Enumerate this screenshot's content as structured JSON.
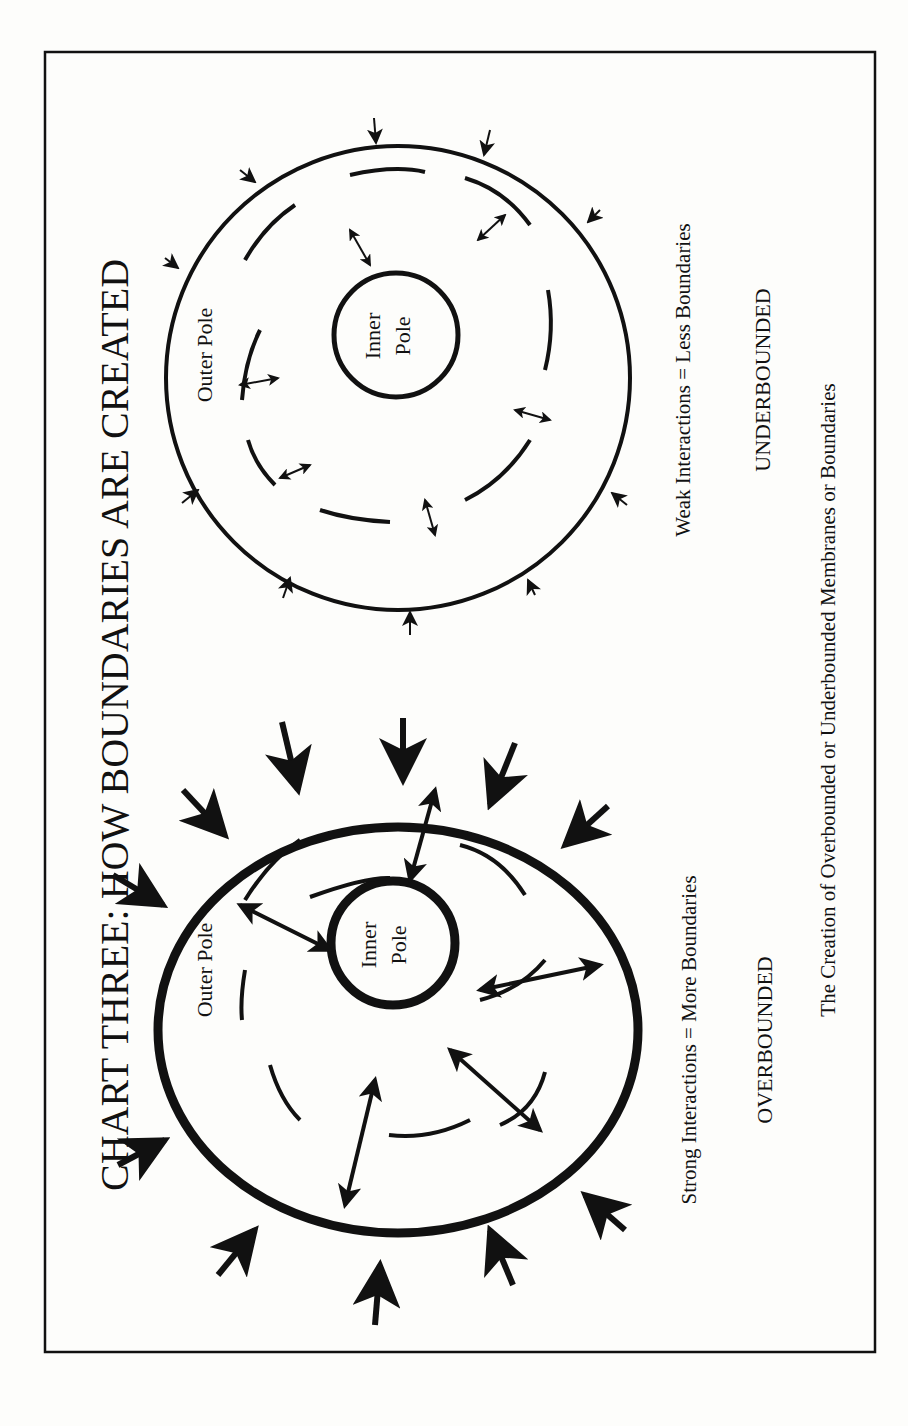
{
  "page": {
    "title": "CHART THREE:   HOW BOUNDARIES ARE CREATED",
    "caption": "The Creation of Overbounded or Underbounded Membranes or Boundaries",
    "orientation": "rotated 90° counter-clockwise (landscape content on portrait page)"
  },
  "left_diagram": {
    "name": "overbounded",
    "outer_label": "Outer Pole",
    "inner_label_line1": "Inner",
    "inner_label_line2": "Pole",
    "description": "Strong Interactions = More Boundaries",
    "label": "OVERBOUNDED",
    "boundary_style": "thick solid outer ring, thick inner ring, bold arrows"
  },
  "right_diagram": {
    "name": "underbounded",
    "outer_label": "Outer Pole",
    "inner_label_line1": "Inner",
    "inner_label_line2": "Pole",
    "description": "Weak Interactions = Less Boundaries",
    "label": "UNDERBOUNDED",
    "boundary_style": "thin outer ring, thin inner ring, small arrows"
  },
  "colors": {
    "ink": "#111111",
    "paper": "#fdfdfb"
  }
}
